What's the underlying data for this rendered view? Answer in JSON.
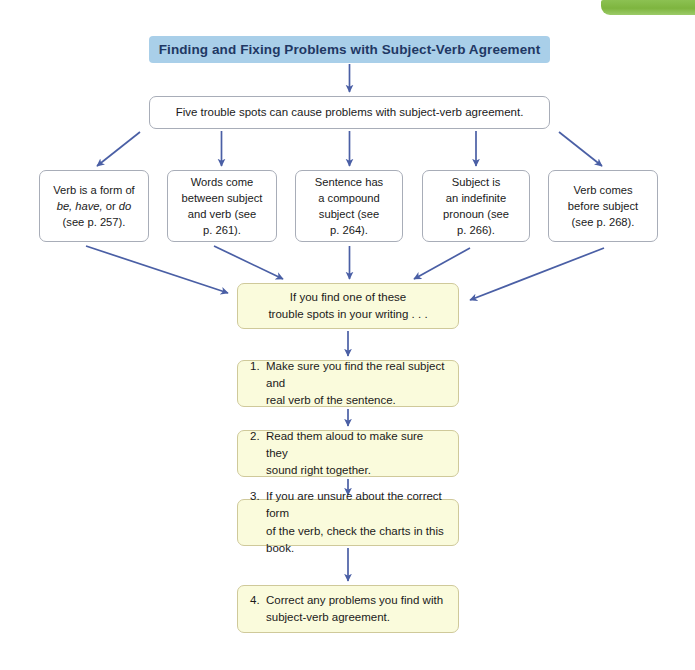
{
  "accent_colors": {
    "title_banner_bg": "#a9cfe9",
    "title_text": "#1f3864",
    "arrow": "#4a5fa5",
    "yellow_box_bg": "#fafbdc",
    "yellow_box_border": "#cfc99a",
    "white_box_border": "#a8adb8",
    "green_tab": "#8cc152"
  },
  "header": {
    "title": "Finding and Fixing Problems with Subject-Verb Agreement",
    "green_tab_name": "chapter-tab"
  },
  "intro": {
    "text": "Five trouble spots can cause problems with subject-verb agreement."
  },
  "trouble_spots": [
    {
      "id": "spot-0",
      "line1": "Verb is a form of",
      "italic_part": "be, have,",
      "line2_pre": "",
      "line2_mid": " or ",
      "italic_part2": "do",
      "line3": "(see p. 257).",
      "plain": "Verb is a form of be, have, or do (see p. 257).",
      "page": "257"
    },
    {
      "id": "spot-1",
      "plain": "Words come between subject and verb (see p. 261).",
      "page": "261"
    },
    {
      "id": "spot-2",
      "plain": "Sentence has a compound subject (see p. 264).",
      "page": "264"
    },
    {
      "id": "spot-3",
      "plain": "Subject is an indefinite pronoun (see p. 266).",
      "page": "266"
    },
    {
      "id": "spot-4",
      "plain": "Verb comes before subject (see p. 268).",
      "page": "268"
    }
  ],
  "converge": {
    "line1": "If you find one of these",
    "line2": "trouble spots in your writing . . ."
  },
  "steps": [
    {
      "number": "1.",
      "line1": "Make sure you find the real subject and",
      "line2": "real verb of the sentence."
    },
    {
      "number": "2.",
      "line1": "Read them aloud to make sure they",
      "line2": "sound right together."
    },
    {
      "number": "3.",
      "line1": "If you are unsure about the correct form",
      "line2": "of the verb, check the charts in this book."
    },
    {
      "number": "4.",
      "line1": "Correct any problems you find with",
      "line2": "subject-verb agreement."
    }
  ],
  "arrows": {
    "count": 14,
    "description": "blue connector arrows"
  }
}
